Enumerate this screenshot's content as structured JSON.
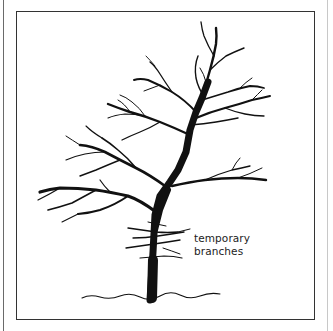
{
  "figure": {
    "annotation": {
      "line1": "temporary",
      "line2": "branches"
    },
    "colors": {
      "ink": "#111111",
      "frame": "#333333",
      "background": "#ffffff"
    }
  }
}
